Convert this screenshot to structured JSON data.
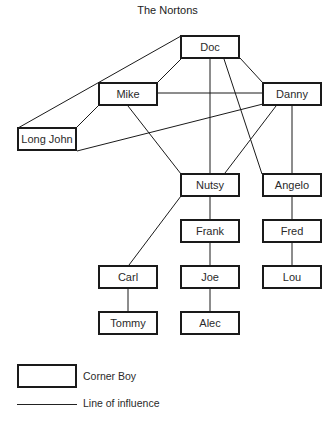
{
  "title": "The Nortons",
  "nodes": {
    "doc": {
      "label": "Doc",
      "x": 180,
      "y": 35,
      "w": 60,
      "h": 24
    },
    "mike": {
      "label": "Mike",
      "x": 98,
      "y": 82,
      "w": 60,
      "h": 24
    },
    "danny": {
      "label": "Danny",
      "x": 262,
      "y": 82,
      "w": 60,
      "h": 24
    },
    "longjohn": {
      "label": "Long John",
      "x": 17,
      "y": 127,
      "w": 60,
      "h": 24
    },
    "nutsy": {
      "label": "Nutsy",
      "x": 180,
      "y": 173,
      "w": 60,
      "h": 24
    },
    "angelo": {
      "label": "Angelo",
      "x": 262,
      "y": 173,
      "w": 60,
      "h": 24
    },
    "frank": {
      "label": "Frank",
      "x": 180,
      "y": 219,
      "w": 60,
      "h": 24
    },
    "fred": {
      "label": "Fred",
      "x": 262,
      "y": 219,
      "w": 60,
      "h": 24
    },
    "carl": {
      "label": "Carl",
      "x": 98,
      "y": 265,
      "w": 60,
      "h": 24
    },
    "joe": {
      "label": "Joe",
      "x": 180,
      "y": 265,
      "w": 60,
      "h": 24
    },
    "lou": {
      "label": "Lou",
      "x": 262,
      "y": 265,
      "w": 60,
      "h": 24
    },
    "tommy": {
      "label": "Tommy",
      "x": 98,
      "y": 311,
      "w": 60,
      "h": 24
    },
    "alec": {
      "label": "Alec",
      "x": 180,
      "y": 311,
      "w": 60,
      "h": 24
    }
  },
  "edges": [
    {
      "from": "doc",
      "to": "mike"
    },
    {
      "from": "doc",
      "to": "danny"
    },
    {
      "from": "doc",
      "to": "longjohn"
    },
    {
      "from": "doc",
      "to": "nutsy"
    },
    {
      "from": "doc",
      "to": "angelo"
    },
    {
      "from": "mike",
      "to": "danny"
    },
    {
      "from": "mike",
      "to": "longjohn"
    },
    {
      "from": "mike",
      "to": "nutsy"
    },
    {
      "from": "danny",
      "to": "longjohn"
    },
    {
      "from": "danny",
      "to": "nutsy"
    },
    {
      "from": "danny",
      "to": "angelo"
    },
    {
      "from": "nutsy",
      "to": "frank"
    },
    {
      "from": "nutsy",
      "to": "carl"
    },
    {
      "from": "frank",
      "to": "joe"
    },
    {
      "from": "joe",
      "to": "alec"
    },
    {
      "from": "carl",
      "to": "tommy"
    },
    {
      "from": "angelo",
      "to": "fred"
    },
    {
      "from": "fred",
      "to": "lou"
    }
  ],
  "legend": {
    "box_label": "Corner Boy",
    "line_label": "Line of influence"
  },
  "colors": {
    "stroke": "#1a1a1a",
    "background": "#ffffff",
    "text": "#2a2a2a"
  }
}
